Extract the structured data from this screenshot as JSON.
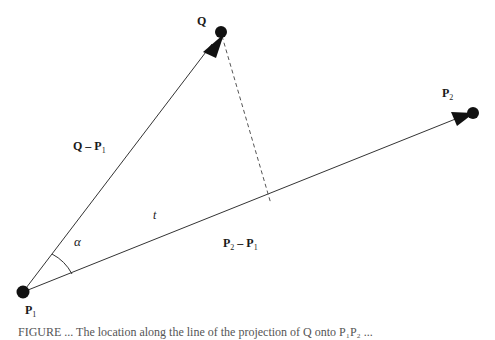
{
  "diagram": {
    "points": {
      "P1": {
        "label": "P",
        "sub": "1",
        "x": 23,
        "y": 292
      },
      "Q": {
        "label": "Q",
        "x": 220,
        "y": 32
      },
      "P2": {
        "label": "P",
        "sub": "2",
        "x": 472,
        "y": 113
      },
      "foot": {
        "x": 271,
        "y": 204
      }
    },
    "labels": {
      "q_label": "Q",
      "p1_main": "P",
      "p1_sub": "1",
      "p2_main": "P",
      "p2_sub": "2",
      "q_minus_p1_main": "Q – P",
      "q_minus_p1_sub": "1",
      "p2_minus_p1_a": "P",
      "p2_minus_p1_a_sub": "2",
      "p2_minus_p1_mid": " – P",
      "p2_minus_p1_b_sub": "1",
      "t_label": "t",
      "alpha_label": "α"
    },
    "edges": [
      {
        "from": "P1",
        "to": "Q",
        "style": "solid",
        "arrow": true
      },
      {
        "from": "P1",
        "to": "P2",
        "style": "solid",
        "arrow": true
      },
      {
        "from": "Q",
        "to": "foot",
        "style": "dashed",
        "arrow": false
      }
    ],
    "colors": {
      "line": "#333333",
      "point": "#111111",
      "dashed": "#555555"
    }
  },
  "caption": {
    "text": "FIGURE ...   The location along the line of the projection of Q onto P₁P₂ ..."
  }
}
